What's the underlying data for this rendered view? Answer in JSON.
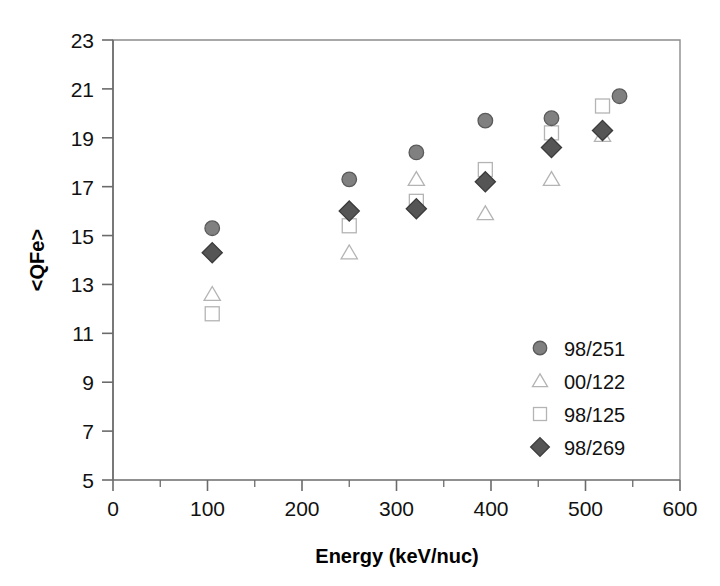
{
  "chart_data": {
    "type": "scatter",
    "title": "",
    "xlabel": "Energy  (keV/nuc)",
    "ylabel": "<QFe>",
    "xlim": [
      0,
      600
    ],
    "ylim": [
      5,
      23
    ],
    "xticks": [
      0,
      100,
      200,
      300,
      400,
      500,
      600
    ],
    "xtick_labels": [
      "0",
      "100",
      "200",
      "300",
      "400",
      "500",
      "600"
    ],
    "x_minor_step": 50,
    "yticks": [
      5,
      7,
      9,
      11,
      13,
      15,
      17,
      19,
      21,
      23
    ],
    "ytick_labels": [
      "5",
      "7",
      "9",
      "11",
      "13",
      "15",
      "17",
      "19",
      "21",
      "23"
    ],
    "grid": false,
    "legend_position": "inside-lower-right",
    "series": [
      {
        "name": "98/251",
        "marker": "circle",
        "fill": "#808080",
        "stroke": "#5a5a5a",
        "points": [
          {
            "x": 105,
            "y": 15.3
          },
          {
            "x": 250,
            "y": 17.3
          },
          {
            "x": 321,
            "y": 18.4
          },
          {
            "x": 394,
            "y": 19.7
          },
          {
            "x": 464,
            "y": 19.8
          },
          {
            "x": 536,
            "y": 20.7
          }
        ]
      },
      {
        "name": "00/122",
        "marker": "triangle",
        "fill": "#ffffff",
        "stroke": "#b4b4b4",
        "points": [
          {
            "x": 105,
            "y": 12.6
          },
          {
            "x": 250,
            "y": 14.3
          },
          {
            "x": 321,
            "y": 17.3
          },
          {
            "x": 394,
            "y": 15.9
          },
          {
            "x": 464,
            "y": 17.3
          },
          {
            "x": 518,
            "y": 19.1
          }
        ]
      },
      {
        "name": "98/125",
        "marker": "square",
        "fill": "#ffffff",
        "stroke": "#b4b4b4",
        "points": [
          {
            "x": 105,
            "y": 11.8
          },
          {
            "x": 250,
            "y": 15.4
          },
          {
            "x": 321,
            "y": 16.4
          },
          {
            "x": 394,
            "y": 17.7
          },
          {
            "x": 464,
            "y": 19.2
          },
          {
            "x": 518,
            "y": 20.3
          }
        ]
      },
      {
        "name": "98/269",
        "marker": "diamond",
        "fill": "#555555",
        "stroke": "#3a3a3a",
        "points": [
          {
            "x": 105,
            "y": 14.3
          },
          {
            "x": 250,
            "y": 16.0
          },
          {
            "x": 321,
            "y": 16.1
          },
          {
            "x": 394,
            "y": 17.2
          },
          {
            "x": 464,
            "y": 18.6
          },
          {
            "x": 518,
            "y": 19.3
          }
        ]
      }
    ]
  },
  "colors": {
    "frame": "#8c8c8c",
    "axis": "#6b6b6b",
    "text": "#111111",
    "background": "#ffffff"
  }
}
